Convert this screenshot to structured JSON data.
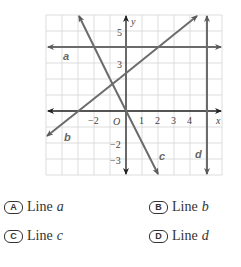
{
  "graph": {
    "axis_labels": {
      "x": "x",
      "y": "y",
      "origin": "O"
    },
    "x_ticks": [
      {
        "value": -2,
        "label": "−2"
      },
      {
        "value": 1,
        "label": "1"
      },
      {
        "value": 2,
        "label": "2"
      },
      {
        "value": 3,
        "label": "3"
      },
      {
        "value": 4,
        "label": "4"
      }
    ],
    "y_ticks": [
      {
        "value": 5,
        "label": "5"
      },
      {
        "value": 3,
        "label": "3"
      },
      {
        "value": -2,
        "label": "−2"
      },
      {
        "value": -3,
        "label": "−3"
      }
    ],
    "grid": {
      "xmin": -5,
      "xmax": 6,
      "ymin": -4,
      "ymax": 6
    },
    "lines": [
      {
        "name": "a",
        "description": "horizontal line y = 4"
      },
      {
        "name": "b",
        "description": "line with positive slope through (-3,0) and (2,4)"
      },
      {
        "name": "c",
        "description": "line with negative slope through origin"
      },
      {
        "name": "d",
        "description": "vertical line x = 5"
      }
    ],
    "colors": {
      "lines": "#6b6b6b",
      "grid": "#d0d0d0",
      "axes": "#333333"
    }
  },
  "choices": [
    {
      "letter": "A",
      "prefix": "Line ",
      "var": "a"
    },
    {
      "letter": "B",
      "prefix": "Line ",
      "var": "b"
    },
    {
      "letter": "C",
      "prefix": "Line ",
      "var": "c"
    },
    {
      "letter": "D",
      "prefix": "Line ",
      "var": "d"
    }
  ]
}
